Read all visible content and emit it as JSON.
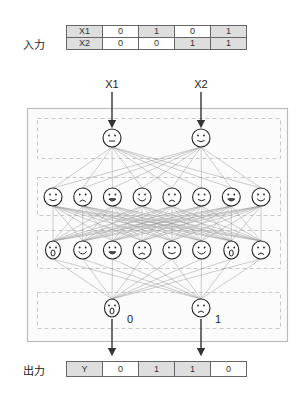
{
  "input": {
    "label": "入力",
    "rows": [
      {
        "header": "X1",
        "values": [
          "0",
          "1",
          "0",
          "1"
        ]
      },
      {
        "header": "X2",
        "values": [
          "0",
          "0",
          "1",
          "1"
        ]
      }
    ]
  },
  "output": {
    "label": "出力",
    "header": "Y",
    "values": [
      "0",
      "1",
      "1",
      "0"
    ]
  },
  "network": {
    "input_arrow_labels": [
      "X1",
      "X2"
    ],
    "layers": [
      {
        "name": "input-layer",
        "faces": [
          "neutral",
          "smile"
        ]
      },
      {
        "name": "hidden-layer-1",
        "faces": [
          "smile",
          "sad",
          "grimace",
          "happy",
          "sad",
          "smile",
          "grimace",
          "happy"
        ]
      },
      {
        "name": "hidden-layer-2",
        "faces": [
          "surprised",
          "happy",
          "grimace",
          "sad",
          "smile",
          "happy",
          "surprised",
          "sad"
        ]
      },
      {
        "name": "output-layer",
        "faces": [
          "surprised",
          "sad"
        ]
      }
    ],
    "output_node_labels": [
      "0",
      "1"
    ]
  },
  "colors": {
    "cell_shade": "#dedede",
    "edge": "#9a9a9a",
    "node_stroke": "#222222",
    "box_border": "#bdbdbd",
    "dashed_border": "#c8c8c8"
  }
}
